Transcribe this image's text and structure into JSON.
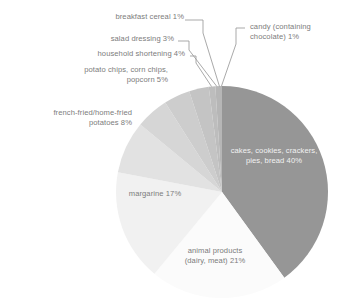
{
  "chart_data": {
    "type": "pie",
    "title": "",
    "subtitle": "",
    "xlabel": "",
    "ylabel": "",
    "grid": false,
    "legend": "none (direct labels with leader lines)",
    "start_angle_deg": 0,
    "direction": "clockwise",
    "total_pct": 100,
    "units": "percent",
    "categories": [
      "cakes, cookies, crackers, pies, bread",
      "animal products (dairy, meat)",
      "margarine",
      "french-fried/home-fried potatoes",
      "potato chips, corn chips, popcorn",
      "household shortening",
      "salad dressing",
      "breakfast cereal",
      "candy (containing chocolate)"
    ],
    "values": [
      40,
      21,
      17,
      8,
      5,
      4,
      3,
      1,
      1
    ],
    "colors": [
      "#969696",
      "#fbfbfb",
      "#f1f1f1",
      "#e2e2e2",
      "#d6d6d6",
      "#cdcdcd",
      "#c4c4c4",
      "#bdbdbd",
      "#b6b6b6"
    ],
    "slices": [
      {
        "label": "cakes, cookies, crackers, pies, bread 40%",
        "name": "cakes, cookies, crackers, pies, bread",
        "value": 40,
        "color": "#969696",
        "label_placement": "inside"
      },
      {
        "label": "animal products (dairy, meat) 21%",
        "name": "animal products (dairy, meat)",
        "value": 21,
        "color": "#fbfbfb",
        "label_placement": "inside"
      },
      {
        "label": "margarine 17%",
        "name": "margarine",
        "value": 17,
        "color": "#f1f1f1",
        "label_placement": "inside"
      },
      {
        "label": "french-fried/home-fried potatoes 8%",
        "name": "french-fried/home-fried potatoes",
        "value": 8,
        "color": "#e2e2e2",
        "label_placement": "outside"
      },
      {
        "label": "potato chips, corn chips, popcorn 5%",
        "name": "potato chips, corn chips, popcorn",
        "value": 5,
        "color": "#d6d6d6",
        "label_placement": "outside"
      },
      {
        "label": "household shortening 4%",
        "name": "household shortening",
        "value": 4,
        "color": "#cdcdcd",
        "label_placement": "outside-leader"
      },
      {
        "label": "salad dressing 3%",
        "name": "salad dressing",
        "value": 3,
        "color": "#c4c4c4",
        "label_placement": "outside-leader"
      },
      {
        "label": "breakfast cereal 1%",
        "name": "breakfast cereal",
        "value": 1,
        "color": "#bdbdbd",
        "label_placement": "outside-leader"
      },
      {
        "label": "candy (containing chocolate) 1%",
        "name": "candy (containing chocolate)",
        "value": 1,
        "color": "#b6b6b6",
        "label_placement": "outside-leader"
      }
    ]
  },
  "labels": {
    "breakfast_cereal": "breakfast cereal 1%",
    "candy": "candy (containing\nchocolate) 1%",
    "salad_dressing": "salad dressing 3%",
    "household_shortening": "household shortening 4%",
    "potato_chips": "potato chips, corn chips,\npopcorn 5%",
    "french_fried": "french-fried/home-fried\npotatoes 8%",
    "margarine": "margarine 17%",
    "animal_products": "animal products\n(dairy, meat) 21%",
    "cakes": "cakes, cookies, crackers,\npies, bread 40%"
  },
  "style": {
    "text_color": "#7c7c7c",
    "dark_slice_text_color": "#f2f2f2",
    "leader_line_color": "#9a9a9a",
    "background": "#ffffff"
  }
}
